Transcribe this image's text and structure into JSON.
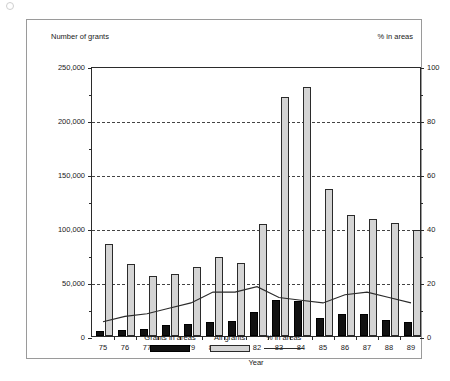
{
  "figure": {
    "left_axis_title": "Number of grants",
    "right_axis_title": "% in areas"
  },
  "chart_data": {
    "type": "bar",
    "title": "",
    "xlabel": "Year",
    "ylabel": "Number of grants",
    "y2label": "% in areas",
    "grid": true,
    "legend_position": "bottom",
    "categories": [
      "75",
      "76",
      "77",
      "78",
      "79",
      "80",
      "81",
      "82",
      "83",
      "84",
      "85",
      "86",
      "87",
      "88",
      "89"
    ],
    "ylim": [
      0,
      250000
    ],
    "yticks": [
      0,
      50000,
      100000,
      150000,
      200000,
      250000
    ],
    "ytick_labels": [
      "0",
      "50,000",
      "100,000",
      "150,000",
      "200,000",
      "250,000"
    ],
    "y2lim": [
      0,
      100
    ],
    "y2ticks": [
      0,
      20,
      40,
      60,
      80,
      100
    ],
    "y2tick_labels": [
      "0",
      "20",
      "40",
      "60",
      "80",
      "100"
    ],
    "series": [
      {
        "name": "Grants in areas",
        "kind": "bar",
        "axis": "left",
        "color": "#111111",
        "values": [
          5000,
          5500,
          6500,
          10000,
          11000,
          13000,
          14000,
          22000,
          33000,
          32000,
          17000,
          20000,
          20000,
          15000,
          13000
        ]
      },
      {
        "name": "All grants",
        "kind": "bar",
        "axis": "left",
        "color": "#d4d4d4",
        "values": [
          85000,
          67000,
          56000,
          57000,
          64000,
          73000,
          68000,
          104000,
          221000,
          231000,
          136000,
          112000,
          108000,
          105000,
          98000
        ]
      },
      {
        "name": "% in areas",
        "kind": "line",
        "axis": "right",
        "color": "#2b2b2b",
        "values": [
          6,
          8,
          9,
          11,
          13,
          17,
          17,
          19,
          15,
          14,
          13,
          16,
          17,
          15,
          13
        ]
      }
    ]
  },
  "legend": {
    "items": [
      {
        "label": "Grants in areas",
        "style": "areas"
      },
      {
        "label": "All grants",
        "style": "all"
      },
      {
        "label": "% in areas",
        "style": "line"
      }
    ]
  }
}
